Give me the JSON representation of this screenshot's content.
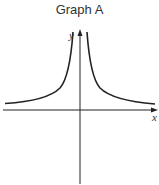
{
  "title": "Graph A",
  "axes": {
    "x_label": "x",
    "y_label": "y"
  },
  "colors": {
    "stroke": "#222222",
    "text": "#333333"
  },
  "curve": {
    "description": "even function with vertical asymptote at x=0, approaching horizontal asymptote above x-axis (y = k/x^2 + c shape)"
  }
}
